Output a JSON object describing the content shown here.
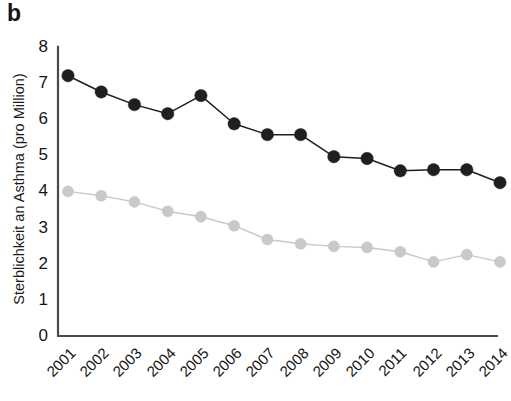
{
  "panel": {
    "label": "b"
  },
  "chart_data": {
    "type": "line",
    "title": "",
    "subtitle": "",
    "xlabel": "",
    "ylabel": "Sterblichkeit an Asthma (pro Million)",
    "categories": [
      "2001",
      "2002",
      "2003",
      "2004",
      "2005",
      "2006",
      "2007",
      "2008",
      "2009",
      "2010",
      "2011",
      "2012",
      "2013",
      "2014"
    ],
    "x": [
      2001,
      2002,
      2003,
      2004,
      2005,
      2006,
      2007,
      2008,
      2009,
      2010,
      2011,
      2012,
      2013,
      2014
    ],
    "ylim": [
      0,
      8
    ],
    "yticks": [
      0,
      1,
      2,
      3,
      4,
      5,
      6,
      7,
      8
    ],
    "ytick_labels": [
      "0",
      "1",
      "2",
      "3",
      "4",
      "5",
      "6",
      "7",
      "8"
    ],
    "grid": false,
    "legend": "none",
    "series": [
      {
        "name": "dark-series",
        "color": "#1f1f1f",
        "marker": "circle",
        "values": [
          7.2,
          6.75,
          6.4,
          6.15,
          6.65,
          5.87,
          5.57,
          5.57,
          4.96,
          4.91,
          4.57,
          4.6,
          4.6,
          4.24
        ]
      },
      {
        "name": "light-series",
        "color": "#c9c9c9",
        "marker": "circle",
        "values": [
          4.0,
          3.88,
          3.71,
          3.45,
          3.3,
          3.05,
          2.67,
          2.55,
          2.48,
          2.45,
          2.33,
          2.05,
          2.25,
          2.05
        ]
      }
    ]
  },
  "axes": {
    "axis_color": "#4a4a4a"
  }
}
